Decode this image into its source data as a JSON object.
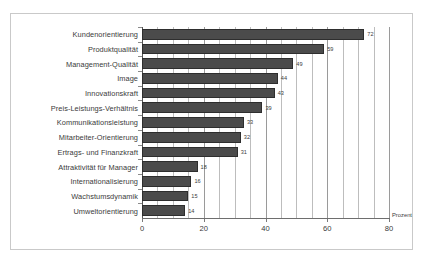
{
  "chart_data": {
    "type": "bar",
    "orientation": "horizontal",
    "title": "",
    "subtitle": "",
    "xlabel": "Prozent",
    "ylabel": "",
    "xlim": [
      0,
      80
    ],
    "xticks": [
      0,
      20,
      40,
      60,
      80
    ],
    "xtick_labels": [
      "0",
      "20",
      "40",
      "60",
      "80"
    ],
    "minor_gridline_step": 5,
    "grid": true,
    "legend": false,
    "bar_color": "#4b4b4b",
    "background_color": "#ffffff",
    "border_color": "#c9c9c9",
    "categories": [
      "Kundenorientierung",
      "Produktqualität",
      "Management-Qualität",
      "Image",
      "Innovationskraft",
      "Preis-Leistungs-Verhältnis",
      "Kommunikationsleistung",
      "Mitarbeiter-Orientierung",
      "Ertrags- und Finanzkraft",
      "Attraktivität für Manager",
      "Internationalisierung",
      "Wachstumsdynamik",
      "Umweltorientierung"
    ],
    "values": [
      72,
      59,
      49,
      44,
      43,
      39,
      33,
      32,
      31,
      18,
      16,
      15,
      14
    ],
    "value_labels": [
      "72",
      "59",
      "49",
      "44",
      "43",
      "39",
      "33",
      "32",
      "31",
      "18",
      "16",
      "15",
      "14"
    ]
  }
}
